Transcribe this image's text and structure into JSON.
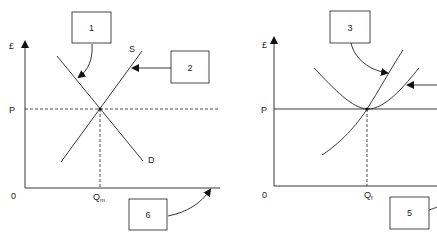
{
  "left_diagram": {
    "y_axis_label": "£",
    "origin_label": "0",
    "price_label": "P",
    "quantity_label": "Q",
    "quantity_subscript": "m",
    "supply_label": "S",
    "demand_label": "D",
    "boxes": [
      {
        "label": "1"
      },
      {
        "label": "2"
      },
      {
        "label": "6"
      }
    ]
  },
  "right_diagram": {
    "y_axis_label": "£",
    "origin_label": "0",
    "price_label": "P",
    "quantity_label": "Q",
    "quantity_subscript": "f",
    "boxes": [
      {
        "label": "3"
      },
      {
        "label": "5"
      }
    ]
  },
  "colors": {
    "line": "#222222",
    "background": "#ffffff"
  }
}
